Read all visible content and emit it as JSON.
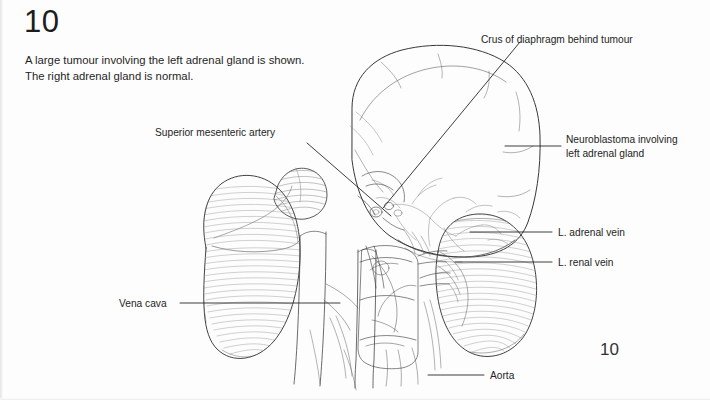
{
  "figure": {
    "number": "10",
    "page_number": "10",
    "caption_line1": "A large tumour involving the left adrenal gland is shown.",
    "caption_line2": "The right adrenal gland is normal."
  },
  "labels": {
    "crus": "Crus of diaphragm behind tumour",
    "neuroblastoma_line1": "Neuroblastoma involving",
    "neuroblastoma_line2": "left adrenal gland",
    "superior_mesenteric_artery": "Superior mesenteric artery",
    "adrenal_vein": "L. adrenal vein",
    "renal_vein": "L. renal vein",
    "vena_cava": "Vena cava",
    "aorta": "Aorta"
  },
  "colors": {
    "ink": "#2b2b2b",
    "leader": "#1a1a1a",
    "hatch": "#8a8a8a",
    "paper": "#fdfdfd"
  }
}
